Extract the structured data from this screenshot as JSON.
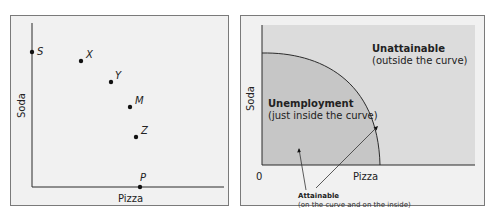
{
  "left_panel": {
    "x_axis_label": "Pizza",
    "y_axis_label": "Soda",
    "points": [
      {
        "label": "S",
        "x": 32,
        "y": 52
      },
      {
        "label": "X",
        "x": 81,
        "y": 61
      },
      {
        "label": "Y",
        "x": 111,
        "y": 82
      },
      {
        "label": "M",
        "x": 130,
        "y": 107
      },
      {
        "label": "Z",
        "x": 136,
        "y": 137
      },
      {
        "label": "P",
        "x": 140,
        "y": 187
      }
    ]
  },
  "right_panel": {
    "x_axis_label": "Pizza",
    "y_axis_label": "Soda",
    "origin_label": "0",
    "unattainable_title": "Unattainable",
    "unattainable_sub": "(outside the curve)",
    "unemployment_title": "Unemployment",
    "unemployment_sub": "(just inside the curve)",
    "attainable_title": "Attainable",
    "attainable_sub": "(on the curve and on the inside)"
  },
  "colors": {
    "panel_bg": "#f1f1f1",
    "outside_region": "#dcdcdc",
    "inside_region": "#c6c6c6",
    "axis": "#2b2b2b"
  }
}
